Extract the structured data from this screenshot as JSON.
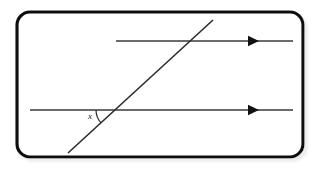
{
  "figure": {
    "canvas": {
      "width": 322,
      "height": 169,
      "background": "#ffffff"
    },
    "frame": {
      "name": "rounded-rectangle-border",
      "x": 17,
      "y": 12,
      "width": 286,
      "height": 145,
      "radius": 13,
      "stroke": "#111111",
      "stroke_width": 3.2,
      "fill": "#ffffff",
      "shadow_color": "#d8d8d8"
    },
    "lines": [
      {
        "name": "upper-parallel-line",
        "label": "upper parallel line",
        "x1": 116,
        "y1": 41,
        "x2": 293,
        "y2": 41,
        "stroke": "#3a3a3a",
        "stroke_width": 1.5,
        "arrow": {
          "name": "arrowhead-right",
          "x": 248,
          "y": 41,
          "size": 5.5,
          "direction": "right",
          "fill": "#111111"
        }
      },
      {
        "name": "lower-parallel-line",
        "label": "lower parallel line",
        "x1": 30,
        "y1": 110,
        "x2": 293,
        "y2": 110,
        "stroke": "#3a3a3a",
        "stroke_width": 1.5,
        "arrow": {
          "name": "arrowhead-right",
          "x": 248,
          "y": 110,
          "size": 5.5,
          "direction": "right",
          "fill": "#111111"
        }
      },
      {
        "name": "transversal-line",
        "label": "transversal",
        "x1": 68,
        "y1": 153,
        "x2": 213,
        "y2": 20,
        "stroke": "#2b2b2b",
        "stroke_width": 1.6,
        "arrow": null
      }
    ],
    "intersections": [
      {
        "name": "intersection-upper",
        "x": 189,
        "y": 41
      },
      {
        "name": "intersection-lower",
        "x": 115,
        "y": 110
      }
    ],
    "angle_arc": {
      "name": "angle-arc-x",
      "center_x": 115,
      "center_y": 110,
      "radius": 19,
      "start_angle_deg": 180,
      "end_angle_deg": 222.5,
      "stroke": "#2b2b2b",
      "stroke_width": 1.2
    },
    "labels": [
      {
        "name": "angle-label-x",
        "text": "x",
        "x": 88,
        "y": 112,
        "style": "italic",
        "color": "#1a1a1a",
        "font_size": 9
      }
    ]
  }
}
